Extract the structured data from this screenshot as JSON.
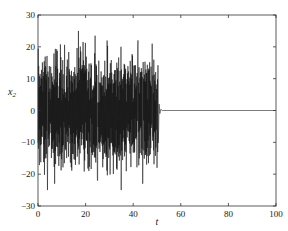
{
  "chart_data": {
    "type": "line",
    "title": "",
    "xlabel": "t",
    "ylabel": "x",
    "ylabel_subscript": "2",
    "xlim": [
      0,
      100
    ],
    "ylim": [
      -30,
      30
    ],
    "xticks": [
      0,
      20,
      40,
      60,
      80,
      100
    ],
    "yticks": [
      -30,
      -20,
      -10,
      0,
      10,
      20,
      30
    ],
    "xtick_labels": [
      "0",
      "20",
      "40",
      "60",
      "80",
      "100"
    ],
    "ytick_labels": [
      "−30",
      "−20",
      "−10",
      "0",
      "10",
      "20",
      "30"
    ],
    "grid": false,
    "legend": null,
    "series": [
      {
        "name": "x2",
        "color": "#111111",
        "segments": [
          {
            "t_range": [
              0,
              50.5
            ],
            "behavior": "chaotic",
            "min": -25,
            "max": 27
          },
          {
            "t_range": [
              50.5,
              100
            ],
            "behavior": "settled",
            "value": 0
          }
        ],
        "notable_peaks": [
          {
            "t": 17,
            "y": 25
          },
          {
            "t": 24,
            "y": 23.5
          },
          {
            "t": 29,
            "y": 22
          },
          {
            "t": 35,
            "y": 27
          },
          {
            "t": 42,
            "y": 22
          },
          {
            "t": 48,
            "y": 21
          }
        ],
        "notable_troughs": [
          {
            "t": 4,
            "y": -25
          },
          {
            "t": 7,
            "y": -23
          },
          {
            "t": 25,
            "y": -22
          },
          {
            "t": 35,
            "y": -25
          },
          {
            "t": 44,
            "y": -23
          },
          {
            "t": 50,
            "y": -18
          }
        ]
      }
    ]
  }
}
